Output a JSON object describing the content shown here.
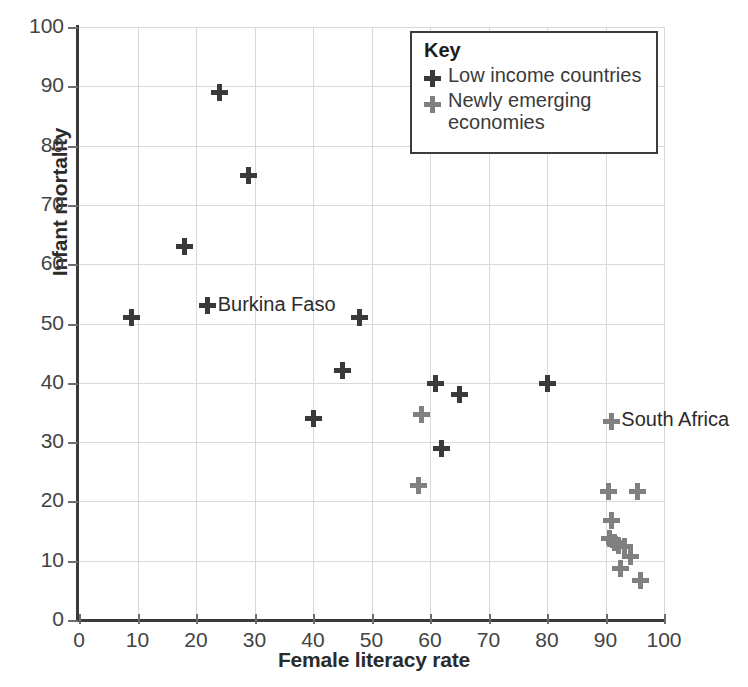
{
  "chart_data": {
    "type": "scatter",
    "title": "",
    "xlabel": "Female literacy rate",
    "ylabel": "Infant mortality",
    "xlim": [
      0,
      100
    ],
    "ylim": [
      0,
      100
    ],
    "xticks": [
      0,
      10,
      20,
      30,
      40,
      50,
      60,
      70,
      80,
      90,
      100
    ],
    "yticks": [
      0,
      10,
      20,
      30,
      40,
      50,
      60,
      70,
      80,
      90,
      100
    ],
    "grid": true,
    "legend_position": "top-right",
    "colors": {
      "low_income": "#3a3a3a",
      "newly_emerging": "#808080",
      "grid": "#d9d9d9",
      "axis": "#3a3a3a",
      "text": "#2b2b2b"
    },
    "series": [
      {
        "name": "Low income countries",
        "marker": "plus",
        "color": "#3a3a3a",
        "points": [
          {
            "x": 9,
            "y": 51
          },
          {
            "x": 18,
            "y": 63
          },
          {
            "x": 22,
            "y": 53,
            "label": "Burkina Faso"
          },
          {
            "x": 24,
            "y": 89
          },
          {
            "x": 29,
            "y": 75
          },
          {
            "x": 40,
            "y": 34
          },
          {
            "x": 45,
            "y": 42
          },
          {
            "x": 48,
            "y": 51
          },
          {
            "x": 61,
            "y": 39.8
          },
          {
            "x": 62,
            "y": 29
          },
          {
            "x": 65,
            "y": 38
          },
          {
            "x": 80,
            "y": 39.8
          }
        ]
      },
      {
        "name": "Newly emerging economies",
        "marker": "plus",
        "color": "#808080",
        "points": [
          {
            "x": 58,
            "y": 22.7
          },
          {
            "x": 58.5,
            "y": 34.7
          },
          {
            "x": 91,
            "y": 33.5,
            "label": "South Africa"
          },
          {
            "x": 90.5,
            "y": 21.7
          },
          {
            "x": 95.5,
            "y": 21.7
          },
          {
            "x": 91,
            "y": 16.7
          },
          {
            "x": 90.6,
            "y": 13.8
          },
          {
            "x": 91.6,
            "y": 13.0
          },
          {
            "x": 92.3,
            "y": 12.6
          },
          {
            "x": 93.2,
            "y": 12.4
          },
          {
            "x": 94.3,
            "y": 10.7
          },
          {
            "x": 92.5,
            "y": 8.7
          },
          {
            "x": 96,
            "y": 6.7
          }
        ]
      }
    ]
  },
  "legend": {
    "title": "Key",
    "entries": [
      {
        "label": "Low income countries",
        "color": "#3a3a3a"
      },
      {
        "label": "Newly emerging economies",
        "color": "#808080"
      }
    ]
  }
}
